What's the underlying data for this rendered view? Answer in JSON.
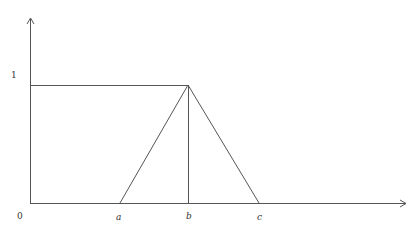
{
  "diagram": {
    "type": "membership-function",
    "labels": {
      "y_one": "1",
      "origin": "0",
      "a": "a",
      "b": "b",
      "c": "c"
    },
    "elements": [
      "y-axis arrow",
      "x-axis arrow",
      "horizontal line at height 1 from 0 to b",
      "triangle with vertices a, b (peak at 1), c",
      "vertical line at b from 0 to 1"
    ],
    "colors": {
      "line": "#555555",
      "text": "#333333"
    }
  }
}
